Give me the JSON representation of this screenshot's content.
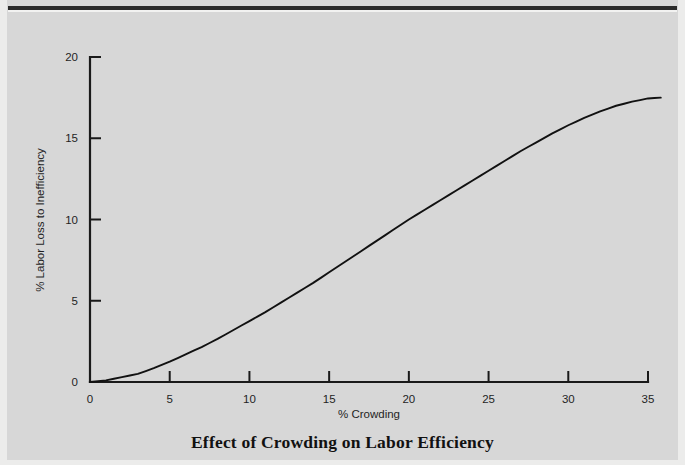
{
  "figure": {
    "title": "Effect of Crowding on Labor Efficiency",
    "background_color": "#d7d7d7",
    "line_color": "#111111",
    "axis_color": "#1a1a1a"
  },
  "chart_data": {
    "type": "line",
    "title": "Effect of Crowding on Labor Efficiency",
    "subtitle": "",
    "xlabel": "% Crowding",
    "ylabel": "% Labor Loss to Inefficiency",
    "xlim": [
      0,
      35
    ],
    "ylim": [
      0,
      20
    ],
    "xticks": [
      0,
      5,
      10,
      15,
      20,
      25,
      30,
      35
    ],
    "yticks": [
      0,
      5,
      10,
      15,
      20
    ],
    "xtick_labels": [
      "0",
      "5",
      "10",
      "15",
      "20",
      "25",
      "30",
      "35"
    ],
    "ytick_labels": [
      "0",
      "5",
      "10",
      "15",
      "20"
    ],
    "grid": false,
    "legend": false,
    "legend_position": "none",
    "annotations": [],
    "series": [
      {
        "name": "Labor loss vs crowding",
        "x": [
          0,
          1,
          2,
          3,
          4,
          5,
          6,
          7,
          8,
          9,
          10,
          11,
          12,
          13,
          14,
          15,
          16,
          17,
          18,
          19,
          20,
          21,
          22,
          23,
          24,
          25,
          26,
          27,
          28,
          29,
          30,
          31,
          32,
          33,
          34,
          35,
          35.8
        ],
        "values": [
          0.0,
          0.1,
          0.3,
          0.5,
          0.85,
          1.25,
          1.7,
          2.15,
          2.65,
          3.2,
          3.75,
          4.3,
          4.9,
          5.5,
          6.1,
          6.75,
          7.4,
          8.05,
          8.7,
          9.35,
          10.0,
          10.6,
          11.2,
          11.8,
          12.4,
          13.0,
          13.6,
          14.2,
          14.75,
          15.3,
          15.8,
          16.25,
          16.65,
          17.0,
          17.25,
          17.45,
          17.5
        ]
      }
    ]
  },
  "axes": {
    "y_axis_label": "% Labor Loss to Inefficiency",
    "x_axis_label": "% Crowding"
  }
}
